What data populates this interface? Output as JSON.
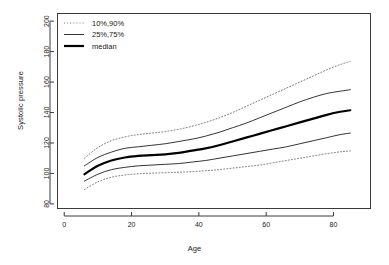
{
  "chart_data": {
    "type": "line",
    "title": "",
    "xlabel": "Age",
    "ylabel": "Systolic pressure",
    "xlim": [
      -2,
      91
    ],
    "ylim": [
      77,
      205
    ],
    "xticks": [
      0,
      20,
      40,
      60,
      80
    ],
    "yticks": [
      80,
      100,
      120,
      140,
      160,
      180,
      200
    ],
    "grid": false,
    "legend_position": "top-left",
    "legend": [
      {
        "label": "10%,90%",
        "style": "dotted",
        "width": 0.8
      },
      {
        "label": "25%,75%",
        "style": "solid",
        "width": 0.8
      },
      {
        "label": "median",
        "style": "solid",
        "width": 2.2
      }
    ],
    "x": [
      6,
      10,
      14,
      18,
      22,
      26,
      30,
      34,
      38,
      42,
      46,
      50,
      54,
      58,
      62,
      66,
      70,
      74,
      78,
      82,
      85
    ],
    "series": [
      {
        "name": "90%",
        "style": "dotted",
        "width": 0.8,
        "values": [
          110,
          117,
          121.5,
          124,
          125.5,
          126.5,
          127.5,
          129,
          131,
          133.5,
          136.5,
          140,
          144,
          148,
          152,
          156,
          160,
          164,
          168,
          171.5,
          173.5
        ]
      },
      {
        "name": "75%",
        "style": "solid",
        "width": 0.8,
        "values": [
          105,
          110.5,
          114,
          116.5,
          117.5,
          118.5,
          119.5,
          121,
          122.5,
          124.5,
          127,
          130,
          133,
          136.5,
          140,
          143.5,
          147,
          150,
          152.5,
          154,
          155
        ]
      },
      {
        "name": "median",
        "style": "solid",
        "width": 2.2,
        "values": [
          99.5,
          105,
          108.5,
          110.5,
          111.5,
          112,
          112.5,
          113.5,
          115,
          116.5,
          118.5,
          121,
          123.5,
          126,
          128.5,
          131,
          133.5,
          136,
          138.5,
          140.5,
          141.5
        ]
      },
      {
        "name": "25%",
        "style": "solid",
        "width": 0.8,
        "values": [
          95,
          99.5,
          102.5,
          104,
          105,
          105.5,
          106,
          106.5,
          107.5,
          108.5,
          110,
          111.5,
          113,
          114.5,
          116,
          117.5,
          119.5,
          121.5,
          123.5,
          125.5,
          126.5
        ]
      },
      {
        "name": "10%",
        "style": "dotted",
        "width": 0.8,
        "values": [
          89.5,
          94.5,
          97.5,
          99,
          99.8,
          100.2,
          100.5,
          100.8,
          101.2,
          101.8,
          102.5,
          103.5,
          104.5,
          105.5,
          107,
          108.5,
          110,
          111.5,
          113,
          114.2,
          114.8
        ]
      }
    ]
  }
}
